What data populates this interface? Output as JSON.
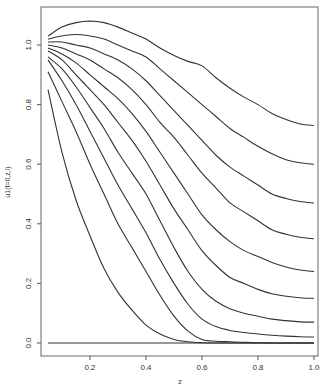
{
  "chart_data": {
    "type": "line",
    "title": "",
    "xlabel": "z",
    "ylabel": "u1(t=0,z,i)",
    "xlim": [
      0.03,
      1.02
    ],
    "ylim": [
      -0.04,
      1.12
    ],
    "x_ticks": [
      0.2,
      0.4,
      0.6,
      0.8,
      1.0
    ],
    "x_tick_labels": [
      "0.2",
      "0.4",
      "0.6",
      "0.8",
      "1.0"
    ],
    "y_ticks": [
      0.0,
      0.2,
      0.4,
      0.6,
      0.8,
      1.0
    ],
    "y_tick_labels": [
      "0.0",
      "0.2",
      "0.4",
      "0.6",
      "0.8",
      "1.0"
    ],
    "grid": false,
    "legend": "none",
    "x": [
      0.05,
      0.1,
      0.15,
      0.2,
      0.25,
      0.3,
      0.35,
      0.4,
      0.45,
      0.5,
      0.55,
      0.6,
      0.65,
      0.7,
      0.75,
      0.8,
      0.85,
      0.9,
      0.95,
      1.0
    ],
    "series": [
      {
        "name": "curve-1",
        "values": [
          1.03,
          1.06,
          1.075,
          1.08,
          1.075,
          1.06,
          1.04,
          1.02,
          0.99,
          0.965,
          0.945,
          0.93,
          0.89,
          0.855,
          0.825,
          0.8,
          0.77,
          0.75,
          0.735,
          0.73
        ]
      },
      {
        "name": "curve-2",
        "values": [
          1.02,
          1.03,
          1.035,
          1.03,
          1.02,
          1.0,
          0.98,
          0.96,
          0.92,
          0.88,
          0.84,
          0.8,
          0.76,
          0.72,
          0.69,
          0.66,
          0.635,
          0.615,
          0.605,
          0.6
        ]
      },
      {
        "name": "curve-3",
        "values": [
          1.01,
          1.01,
          1.0,
          0.99,
          0.97,
          0.95,
          0.92,
          0.88,
          0.83,
          0.78,
          0.73,
          0.68,
          0.63,
          0.59,
          0.56,
          0.53,
          0.5,
          0.485,
          0.475,
          0.47
        ]
      },
      {
        "name": "curve-4",
        "values": [
          1.0,
          0.99,
          0.97,
          0.95,
          0.92,
          0.89,
          0.85,
          0.8,
          0.74,
          0.69,
          0.63,
          0.57,
          0.52,
          0.47,
          0.44,
          0.41,
          0.38,
          0.365,
          0.355,
          0.35
        ]
      },
      {
        "name": "curve-5",
        "values": [
          0.99,
          0.97,
          0.94,
          0.9,
          0.86,
          0.82,
          0.77,
          0.71,
          0.64,
          0.57,
          0.5,
          0.43,
          0.38,
          0.34,
          0.31,
          0.29,
          0.27,
          0.255,
          0.245,
          0.24
        ]
      },
      {
        "name": "curve-6",
        "values": [
          0.98,
          0.95,
          0.9,
          0.85,
          0.8,
          0.74,
          0.68,
          0.61,
          0.53,
          0.45,
          0.38,
          0.31,
          0.26,
          0.22,
          0.2,
          0.18,
          0.165,
          0.157,
          0.152,
          0.15
        ]
      },
      {
        "name": "curve-7",
        "values": [
          0.96,
          0.92,
          0.86,
          0.79,
          0.72,
          0.64,
          0.57,
          0.5,
          0.41,
          0.32,
          0.24,
          0.18,
          0.14,
          0.115,
          0.1,
          0.09,
          0.08,
          0.075,
          0.071,
          0.07
        ]
      },
      {
        "name": "curve-8",
        "values": [
          0.95,
          0.88,
          0.8,
          0.71,
          0.62,
          0.53,
          0.45,
          0.37,
          0.28,
          0.2,
          0.13,
          0.08,
          0.055,
          0.042,
          0.035,
          0.03,
          0.026,
          0.023,
          0.021,
          0.02
        ]
      },
      {
        "name": "curve-9",
        "values": [
          0.91,
          0.81,
          0.71,
          0.6,
          0.5,
          0.4,
          0.32,
          0.24,
          0.16,
          0.09,
          0.04,
          0.012,
          0.006,
          0.004,
          0.002,
          0.001,
          0.0,
          0.0,
          0.0,
          0.0
        ]
      },
      {
        "name": "curve-10",
        "values": [
          0.85,
          0.64,
          0.48,
          0.36,
          0.25,
          0.17,
          0.11,
          0.06,
          0.03,
          0.012,
          0.004,
          0.001,
          0.0,
          0.0,
          0.0,
          0.0,
          0.0,
          0.0,
          0.0,
          0.0
        ]
      },
      {
        "name": "curve-11",
        "values": [
          0.0,
          0.0,
          0.0,
          0.0,
          0.0,
          0.0,
          0.0,
          0.0,
          0.0,
          0.0,
          0.0,
          0.0,
          0.0,
          0.0,
          0.0,
          0.0,
          0.0,
          0.0,
          0.0,
          0.0
        ]
      }
    ]
  }
}
